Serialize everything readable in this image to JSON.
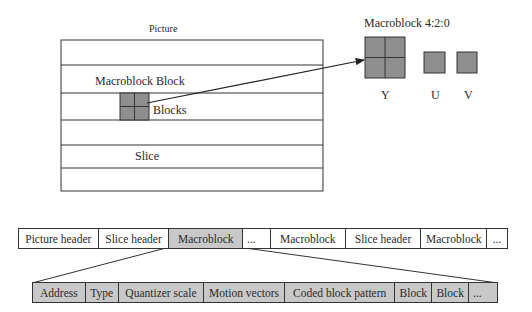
{
  "picture": {
    "title": "Picture",
    "macroblock_label": "Macroblock Block",
    "blocks_label": "Blocks",
    "slice_label": "Slice"
  },
  "macroblock_420": {
    "title": "Macroblock 4:2:0",
    "components": [
      {
        "label": "Y"
      },
      {
        "label": "U"
      },
      {
        "label": "V"
      }
    ]
  },
  "stream_row": {
    "cells": [
      {
        "label": "Picture header",
        "highlighted": false
      },
      {
        "label": "Slice header",
        "highlighted": false
      },
      {
        "label": "Macroblock",
        "highlighted": true
      },
      {
        "label": "...",
        "highlighted": false
      },
      {
        "label": "Macroblock",
        "highlighted": false
      },
      {
        "label": "Slice header",
        "highlighted": false
      },
      {
        "label": "Macroblock",
        "highlighted": false
      },
      {
        "label": "...",
        "highlighted": false
      }
    ]
  },
  "macroblock_row": {
    "cells": [
      {
        "label": "Address"
      },
      {
        "label": "Type"
      },
      {
        "label": "Quantizer scale"
      },
      {
        "label": "Motion vectors"
      },
      {
        "label": "Coded block pattern"
      },
      {
        "label": "Block"
      },
      {
        "label": "Block"
      },
      {
        "label": "..."
      }
    ]
  },
  "colors": {
    "block_fill": "#8e8e8e",
    "highlight_fill": "#c8c8c8",
    "line": "#333333"
  }
}
